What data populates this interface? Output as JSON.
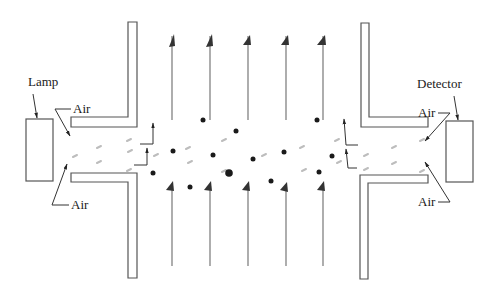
{
  "figure": {
    "labels": {
      "lamp": "Lamp",
      "detector": "Detector",
      "air_top_left": "Air",
      "air_bottom_left": "Air",
      "air_top_right": "Air",
      "air_bottom_right": "Air"
    },
    "colors": {
      "line": "#555555",
      "arrow": "#333333",
      "particle": "#1a1a1a",
      "light_path": "#bdbdbd"
    },
    "components": [
      "lamp-box",
      "detector-box",
      "left-top-wall",
      "left-bottom-wall",
      "right-top-wall",
      "right-bottom-wall"
    ],
    "flow_lines": {
      "top_count": 5,
      "bottom_count": 5,
      "direction": "upward"
    }
  }
}
